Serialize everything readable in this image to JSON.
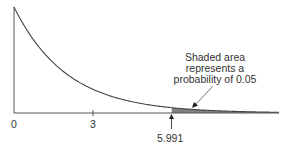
{
  "chart_data": {
    "type": "area",
    "title": "",
    "distribution": "chi-square, 2 degrees of freedom",
    "xlabel": "",
    "ylabel": "",
    "x_ticks": [
      {
        "value": 0,
        "label": "0"
      },
      {
        "value": 3,
        "label": "3"
      }
    ],
    "critical_value": {
      "value": 5.991,
      "label": "5.991"
    },
    "shaded_region": {
      "from": 5.991,
      "to": "infinity",
      "probability": 0.05
    },
    "annotation": {
      "lines": [
        "Shaded area",
        "represents a",
        "probability of 0.05"
      ]
    },
    "curve": {
      "x": [
        0,
        1,
        2,
        3,
        4,
        5,
        5.991,
        7,
        8,
        9,
        10
      ],
      "y": [
        0.5,
        0.303,
        0.184,
        0.112,
        0.068,
        0.041,
        0.025,
        0.015,
        0.009,
        0.006,
        0.003
      ]
    },
    "xlim": [
      0,
      10
    ],
    "grid": false,
    "legend": "none"
  },
  "labels": {
    "tick_0": "0",
    "tick_3": "3",
    "critical": "5.991",
    "note_line1": "Shaded area",
    "note_line2": "represents a",
    "note_line3": "probability of 0.05"
  },
  "colors": {
    "line": "#444444",
    "shade": "#808080"
  }
}
